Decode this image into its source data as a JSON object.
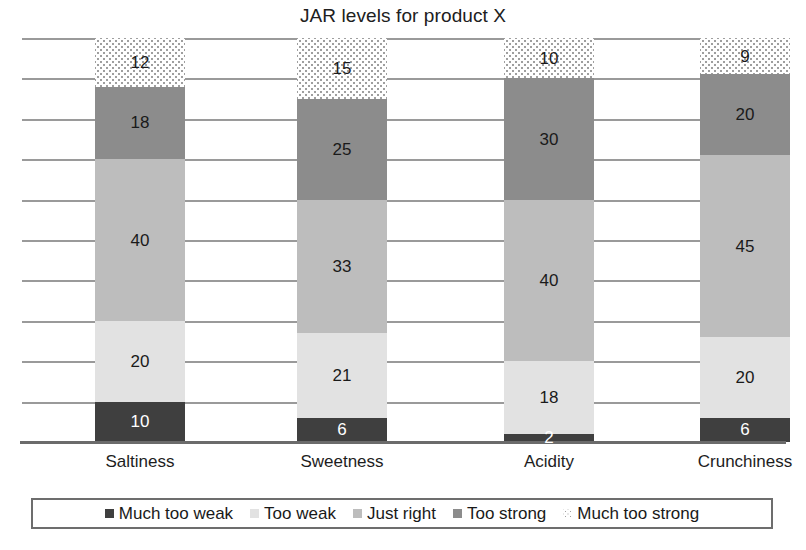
{
  "chart_data": {
    "type": "bar",
    "title": "JAR levels for product X",
    "xlabel": "",
    "ylabel": "",
    "ylim": [
      0,
      100
    ],
    "grid": true,
    "gridline_interval": 10,
    "stacked": true,
    "orientation": "vertical",
    "legend_position": "bottom",
    "categories": [
      "Saltiness",
      "Sweetness",
      "Acidity",
      "Crunchiness"
    ],
    "series": [
      {
        "name": "Much too weak",
        "color": "#3f3f3f",
        "pattern": "solid",
        "values": [
          10,
          6,
          2,
          6
        ]
      },
      {
        "name": "Too weak",
        "color": "#e2e2e2",
        "pattern": "solid",
        "values": [
          20,
          21,
          18,
          20
        ]
      },
      {
        "name": "Just right",
        "color": "#bdbdbd",
        "pattern": "solid",
        "values": [
          40,
          33,
          40,
          45
        ]
      },
      {
        "name": "Too strong",
        "color": "#8c8c8c",
        "pattern": "solid",
        "values": [
          18,
          25,
          30,
          20
        ]
      },
      {
        "name": "Much too strong",
        "color": "#ffffff",
        "pattern": "dotted",
        "values": [
          12,
          15,
          10,
          9
        ]
      }
    ]
  },
  "legend": {
    "items": [
      {
        "label": "Much too weak",
        "swatch": "much-too-weak"
      },
      {
        "label": "Too weak",
        "swatch": "too-weak"
      },
      {
        "label": "Just right",
        "swatch": "just-right"
      },
      {
        "label": "Too strong",
        "swatch": "too-strong"
      },
      {
        "label": "Much too strong",
        "swatch": "much-too-strong"
      }
    ]
  }
}
